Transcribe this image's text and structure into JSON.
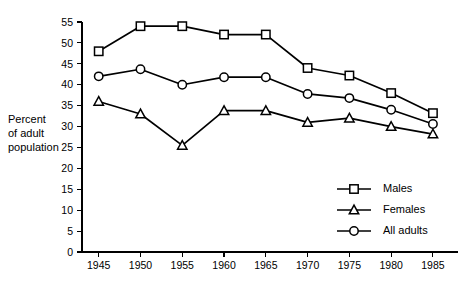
{
  "chart_data": {
    "type": "line",
    "title": "",
    "subtitle": "",
    "xlabel": "",
    "ylabel": "Percent of adult population",
    "ylabel_lines": [
      "Percent",
      "of adult",
      "population"
    ],
    "x": [
      1945,
      1950,
      1955,
      1960,
      1965,
      1970,
      1975,
      1980,
      1985
    ],
    "categories": [
      "1945",
      "1950",
      "1955",
      "1960",
      "1965",
      "1970",
      "1975",
      "1980",
      "1985"
    ],
    "xlim": [
      1943,
      1988
    ],
    "ylim": [
      0,
      55
    ],
    "yticks": [
      0,
      5,
      10,
      15,
      20,
      25,
      30,
      35,
      40,
      45,
      50,
      55
    ],
    "ytick_labels": [
      "0",
      "5",
      "10",
      "15",
      "20",
      "25",
      "30",
      "35",
      "40",
      "45",
      "50",
      "55"
    ],
    "grid": false,
    "legend_position": "inside-lower-right",
    "series": [
      {
        "name": "Males",
        "marker": "square",
        "values": [
          48.0,
          54.0,
          54.0,
          52.0,
          52.0,
          44.0,
          42.2,
          38.0,
          33.2
        ]
      },
      {
        "name": "Females",
        "marker": "triangle",
        "values": [
          36.0,
          33.0,
          25.5,
          33.8,
          33.8,
          31.0,
          32.0,
          30.0,
          28.2
        ]
      },
      {
        "name": "All adults",
        "marker": "circle",
        "values": [
          42.0,
          43.7,
          40.0,
          41.8,
          41.8,
          37.8,
          36.8,
          34.0,
          30.6
        ]
      }
    ]
  },
  "legend": {
    "entries": [
      {
        "label": "Males",
        "marker": "square"
      },
      {
        "label": "Females",
        "marker": "triangle"
      },
      {
        "label": "All adults",
        "marker": "circle"
      }
    ]
  },
  "colors": {
    "background": "#ffffff",
    "foreground": "#000000",
    "marker_fill": "#ffffff"
  }
}
